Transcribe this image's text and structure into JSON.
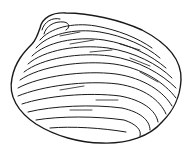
{
  "image": {
    "subject": "clam shell line drawing",
    "background": "#ffffff",
    "stroke_color": "#1a1a1a"
  }
}
